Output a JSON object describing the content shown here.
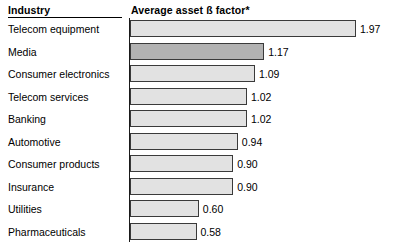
{
  "header": {
    "industry_label": "Industry",
    "measure_label": "Average asset ß factor*"
  },
  "colors": {
    "bar_fill": "#e2e2e2",
    "bar_highlight_fill": "#b2b2b2",
    "bar_border": "#3a3a3a",
    "axis": "#1a1a1a",
    "text": "#000000",
    "background": "#ffffff"
  },
  "chart_data": {
    "type": "bar",
    "orientation": "horizontal",
    "title": "Average asset ß factor*",
    "xlabel": "Average asset ß factor*",
    "ylabel": "Industry",
    "xlim": [
      0,
      1.97
    ],
    "grid": false,
    "legend": false,
    "value_format": "0.00",
    "categories": [
      "Telecom equipment",
      "Media",
      "Consumer electronics",
      "Telecom services",
      "Banking",
      "Automotive",
      "Consumer products",
      "Insurance",
      "Utilities",
      "Pharmaceuticals"
    ],
    "values": [
      1.97,
      1.17,
      1.09,
      1.02,
      1.02,
      0.94,
      0.9,
      0.9,
      0.6,
      0.58
    ],
    "value_labels": [
      "1.97",
      "1.17",
      "1.09",
      "1.02",
      "1.02",
      "0.94",
      "0.90",
      "0.90",
      "0.60",
      "0.58"
    ],
    "highlighted": [
      "Media"
    ],
    "bars": [
      {
        "category": "Telecom equipment",
        "value": 1.97,
        "label": "1.97",
        "highlight": false
      },
      {
        "category": "Media",
        "value": 1.17,
        "label": "1.17",
        "highlight": true
      },
      {
        "category": "Consumer electronics",
        "value": 1.09,
        "label": "1.09",
        "highlight": false
      },
      {
        "category": "Telecom services",
        "value": 1.02,
        "label": "1.02",
        "highlight": false
      },
      {
        "category": "Banking",
        "value": 1.02,
        "label": "1.02",
        "highlight": false
      },
      {
        "category": "Automotive",
        "value": 0.94,
        "label": "0.94",
        "highlight": false
      },
      {
        "category": "Consumer products",
        "value": 0.9,
        "label": "0.90",
        "highlight": false
      },
      {
        "category": "Insurance",
        "value": 0.9,
        "label": "0.90",
        "highlight": false
      },
      {
        "category": "Utilities",
        "value": 0.6,
        "label": "0.60",
        "highlight": false
      },
      {
        "category": "Pharmaceuticals",
        "value": 0.58,
        "label": "0.58",
        "highlight": false
      }
    ]
  }
}
